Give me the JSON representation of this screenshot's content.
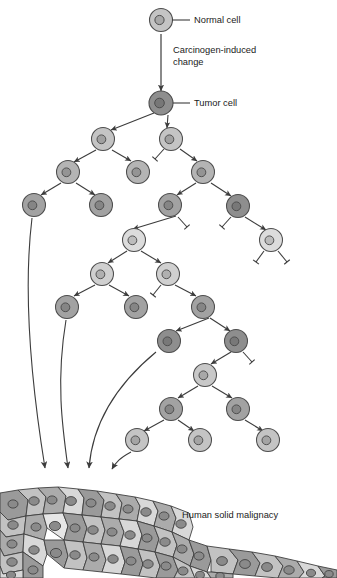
{
  "figure": {
    "title_visible": false,
    "type": "biological-schematic"
  },
  "labels": {
    "normal_cell": "Normal cell",
    "carcinogen_change_line1": "Carcinogen-induced",
    "carcinogen_change_line2": "change",
    "tumor_cell": "Tumor cell",
    "solid_malignancy": "Human solid malignacy"
  },
  "colors": {
    "background": "#ffffff",
    "outline": "#4d4d4d",
    "arrow": "#3c3c3c",
    "text": "#1a1a1a",
    "cell_lightest": "#e2e2e2",
    "cell_light": "#d2d2d2",
    "cell_medium_light": "#c4c4c4",
    "cell_medium": "#b4b4b4",
    "cell_medium_dark": "#a2a2a2",
    "cell_dark": "#8e8e8e",
    "nucleus_light": "#c0c0c0",
    "nucleus_medium": "#a0a0a0",
    "nucleus_dark": "#7c7c7c",
    "mass_fill_a": "#d8d8d8",
    "mass_fill_b": "#c2c2c2",
    "mass_fill_c": "#ababab",
    "mass_fill_d": "#9a9a9a",
    "mass_nucleus": "#8a8a8a"
  },
  "top_chain": {
    "normal_cell": {
      "x": 161,
      "y": 20,
      "r": 11.5,
      "fill": "#c4c4c4",
      "nucleus_r": 4.6,
      "nucleus_fill": "#a8a8a8"
    },
    "leader_line": {
      "x1": 172,
      "y1": 20,
      "x2": 190,
      "y2": 20
    },
    "normal_cell_label_pos": {
      "x": 194,
      "y": 23
    },
    "vertical_arrow": {
      "x": 161,
      "y1": 34,
      "y2": 91
    },
    "carcinogen_label_pos": {
      "x": 173,
      "y": 53
    },
    "tumor_cell": {
      "x": 161,
      "y": 103,
      "r": 12,
      "fill": "#8e8e8e",
      "nucleus_r": 4.8,
      "nucleus_fill": "#777777"
    },
    "tumor_leader_line": {
      "x1": 173,
      "y1": 103,
      "x2": 190,
      "y2": 103
    },
    "tumor_cell_label_pos": {
      "x": 194,
      "y": 106
    }
  },
  "tree_nodes": [
    {
      "id": "n1",
      "x": 103,
      "y": 139,
      "r": 11.5,
      "fill": "#c4c4c4",
      "nucleus_fill": "#a0a0a0",
      "nucleus_r": 4.4
    },
    {
      "id": "n2",
      "x": 171,
      "y": 139,
      "r": 11.5,
      "fill": "#c4c4c4",
      "nucleus_fill": "#a0a0a0",
      "nucleus_r": 4.4
    },
    {
      "id": "n3",
      "x": 68,
      "y": 172,
      "r": 11.5,
      "fill": "#b4b4b4",
      "nucleus_fill": "#949494",
      "nucleus_r": 4.4
    },
    {
      "id": "n4",
      "x": 138,
      "y": 172,
      "r": 11.5,
      "fill": "#b4b4b4",
      "nucleus_fill": "#949494",
      "nucleus_r": 4.4
    },
    {
      "id": "n5",
      "x": 203,
      "y": 172,
      "r": 11.5,
      "fill": "#b4b4b4",
      "nucleus_fill": "#949494",
      "nucleus_r": 4.4
    },
    {
      "id": "n6",
      "x": 34,
      "y": 205,
      "r": 11.5,
      "fill": "#a2a2a2",
      "nucleus_fill": "#858585",
      "nucleus_r": 4.4
    },
    {
      "id": "n7",
      "x": 101,
      "y": 205,
      "r": 11.5,
      "fill": "#a2a2a2",
      "nucleus_fill": "#858585",
      "nucleus_r": 4.4
    },
    {
      "id": "n8",
      "x": 170,
      "y": 205,
      "r": 11.5,
      "fill": "#a2a2a2",
      "nucleus_fill": "#858585",
      "nucleus_r": 4.4
    },
    {
      "id": "n9",
      "x": 238,
      "y": 206,
      "r": 11.5,
      "fill": "#8e8e8e",
      "nucleus_fill": "#787878",
      "nucleus_r": 4.4
    },
    {
      "id": "n10",
      "x": 134,
      "y": 240,
      "r": 11.5,
      "fill": "#dcdcdc",
      "nucleus_fill": "#bcbcbc",
      "nucleus_r": 4.4
    },
    {
      "id": "n11",
      "x": 271,
      "y": 240,
      "r": 11.5,
      "fill": "#dcdcdc",
      "nucleus_fill": "#bcbcbc",
      "nucleus_r": 4.4
    },
    {
      "id": "n12",
      "x": 102,
      "y": 274,
      "r": 11.5,
      "fill": "#d0d0d0",
      "nucleus_fill": "#b0b0b0",
      "nucleus_r": 4.4
    },
    {
      "id": "n13",
      "x": 168,
      "y": 274,
      "r": 11.5,
      "fill": "#d0d0d0",
      "nucleus_fill": "#b0b0b0",
      "nucleus_r": 4.4
    },
    {
      "id": "n14",
      "x": 67,
      "y": 307,
      "r": 11.5,
      "fill": "#a2a2a2",
      "nucleus_fill": "#858585",
      "nucleus_r": 4.4
    },
    {
      "id": "n15",
      "x": 136,
      "y": 307,
      "r": 11.5,
      "fill": "#a2a2a2",
      "nucleus_fill": "#858585",
      "nucleus_r": 4.4
    },
    {
      "id": "n16",
      "x": 203,
      "y": 307,
      "r": 11.5,
      "fill": "#a2a2a2",
      "nucleus_fill": "#858585",
      "nucleus_r": 4.4
    },
    {
      "id": "n17",
      "x": 169,
      "y": 341,
      "r": 11.5,
      "fill": "#8e8e8e",
      "nucleus_fill": "#787878",
      "nucleus_r": 4.4
    },
    {
      "id": "n18",
      "x": 236,
      "y": 341,
      "r": 11.5,
      "fill": "#8e8e8e",
      "nucleus_fill": "#787878",
      "nucleus_r": 4.4
    },
    {
      "id": "n19",
      "x": 205,
      "y": 375,
      "r": 11.5,
      "fill": "#c8c8c8",
      "nucleus_fill": "#a8a8a8",
      "nucleus_r": 4.4
    },
    {
      "id": "n20",
      "x": 171,
      "y": 409,
      "r": 11.5,
      "fill": "#a2a2a2",
      "nucleus_fill": "#858585",
      "nucleus_r": 4.4
    },
    {
      "id": "n21",
      "x": 238,
      "y": 409,
      "r": 11.5,
      "fill": "#a2a2a2",
      "nucleus_fill": "#858585",
      "nucleus_r": 4.4
    },
    {
      "id": "n22",
      "x": 137,
      "y": 440,
      "r": 11.5,
      "fill": "#c4c4c4",
      "nucleus_fill": "#a4a4a4",
      "nucleus_r": 4.4
    },
    {
      "id": "n23",
      "x": 200,
      "y": 440,
      "r": 11.5,
      "fill": "#c4c4c4",
      "nucleus_fill": "#a4a4a4",
      "nucleus_r": 4.4
    },
    {
      "id": "n24",
      "x": 268,
      "y": 440,
      "r": 11.5,
      "fill": "#c4c4c4",
      "nucleus_fill": "#a4a4a4",
      "nucleus_r": 4.4
    }
  ],
  "tree_arrows": [
    {
      "from": [
        154,
        113
      ],
      "to": [
        111,
        130
      ]
    },
    {
      "from": [
        168,
        115
      ],
      "to": [
        167,
        128
      ]
    },
    {
      "from": [
        96,
        150
      ],
      "to": [
        74,
        162
      ]
    },
    {
      "from": [
        112,
        150
      ],
      "to": [
        131,
        161
      ]
    },
    {
      "from": [
        180,
        149
      ],
      "to": [
        197,
        161
      ]
    },
    {
      "from": [
        61,
        183
      ],
      "to": [
        41,
        195
      ]
    },
    {
      "from": [
        76,
        183
      ],
      "to": [
        95,
        195
      ]
    },
    {
      "from": [
        196,
        183
      ],
      "to": [
        177,
        195
      ]
    },
    {
      "from": [
        211,
        183
      ],
      "to": [
        231,
        196
      ]
    },
    {
      "from": [
        176,
        216
      ],
      "to": [
        133,
        229
      ]
    },
    {
      "from": [
        245,
        217
      ],
      "to": [
        266,
        230
      ]
    },
    {
      "from": [
        127,
        251
      ],
      "to": [
        108,
        263
      ]
    },
    {
      "from": [
        141,
        251
      ],
      "to": [
        161,
        263
      ]
    },
    {
      "from": [
        95,
        285
      ],
      "to": [
        74,
        296
      ]
    },
    {
      "from": [
        109,
        285
      ],
      "to": [
        129,
        296
      ]
    },
    {
      "from": [
        175,
        285
      ],
      "to": [
        196,
        296
      ]
    },
    {
      "from": [
        209,
        318
      ],
      "to": [
        176,
        331
      ]
    },
    {
      "from": [
        210,
        318
      ],
      "to": [
        230,
        331
      ]
    },
    {
      "from": [
        231,
        352
      ],
      "to": [
        211,
        364
      ]
    },
    {
      "from": [
        198,
        386
      ],
      "to": [
        178,
        398
      ]
    },
    {
      "from": [
        212,
        386
      ],
      "to": [
        232,
        398
      ]
    },
    {
      "from": [
        164,
        420
      ],
      "to": [
        144,
        431
      ]
    },
    {
      "from": [
        178,
        420
      ],
      "to": [
        194,
        431
      ]
    },
    {
      "from": [
        245,
        420
      ],
      "to": [
        263,
        431
      ]
    }
  ],
  "dead_end_bars": [
    {
      "from": [
        164,
        149
      ],
      "to": [
        155,
        159
      ]
    },
    {
      "from": [
        178,
        217
      ],
      "to": [
        187,
        227
      ]
    },
    {
      "from": [
        231,
        217
      ],
      "to": [
        222,
        227
      ]
    },
    {
      "from": [
        264,
        251
      ],
      "to": [
        256,
        262
      ]
    },
    {
      "from": [
        278,
        251
      ],
      "to": [
        287,
        262
      ]
    },
    {
      "from": [
        161,
        285
      ],
      "to": [
        153,
        295
      ]
    },
    {
      "from": [
        243,
        352
      ],
      "to": [
        252,
        362
      ]
    }
  ],
  "metastasis_arrows": [
    {
      "start": [
        32,
        218
      ],
      "c1": [
        22,
        300
      ],
      "c2": [
        34,
        400
      ],
      "end": [
        45,
        468
      ]
    },
    {
      "start": [
        66,
        320
      ],
      "c1": [
        56,
        380
      ],
      "c2": [
        62,
        425
      ],
      "end": [
        68,
        468
      ]
    },
    {
      "start": [
        156,
        352
      ],
      "c1": [
        110,
        390
      ],
      "c2": [
        92,
        430
      ],
      "end": [
        89,
        468
      ]
    },
    {
      "start": [
        131,
        452
      ],
      "c1": [
        120,
        458
      ],
      "c2": [
        116,
        462
      ],
      "end": [
        112,
        469
      ]
    }
  ],
  "tumor_mass": {
    "outline_top_y": 487,
    "label_pos": {
      "x": 182,
      "y": 518
    },
    "cells": [
      {
        "pts": "0,493 18,490 28,500 26,516 8,520 0,512",
        "fill": "#9a9a9a",
        "nx": 13,
        "ny": 504,
        "nr": 5.0
      },
      {
        "pts": "18,490 38,488 46,497 43,514 26,516 28,500",
        "fill": "#c2c2c2",
        "nx": 34,
        "ny": 501,
        "nr": 5.2
      },
      {
        "pts": "38,488 58,487 66,496 63,513 43,514 46,497",
        "fill": "#ababab",
        "nx": 52,
        "ny": 500,
        "nr": 5.0
      },
      {
        "pts": "58,487 78,489 84,498 82,515 63,513 66,496",
        "fill": "#d8d8d8",
        "nx": 71,
        "ny": 501,
        "nr": 5.4
      },
      {
        "pts": "78,489 97,491 104,500 101,517 82,515 84,498",
        "fill": "#9a9a9a",
        "nx": 91,
        "ny": 503,
        "nr": 5.0
      },
      {
        "pts": "97,491 116,494 122,503 119,519 101,517 104,500",
        "fill": "#c2c2c2",
        "nx": 110,
        "ny": 506,
        "nr": 5.2
      },
      {
        "pts": "116,494 135,497 140,506 137,521 119,519 122,503",
        "fill": "#ababab",
        "nx": 128,
        "ny": 509,
        "nr": 5.0
      },
      {
        "pts": "135,497 153,501 158,511 154,526 137,521 140,506",
        "fill": "#d8d8d8",
        "nx": 146,
        "ny": 512,
        "nr": 5.2
      },
      {
        "pts": "0,512 8,520 26,516 24,534 6,537 0,530",
        "fill": "#c2c2c2",
        "nx": 13,
        "ny": 525,
        "nr": 5.2
      },
      {
        "pts": "26,516 43,514 47,528 44,540 24,534",
        "fill": "#ababab",
        "nx": 36,
        "ny": 527,
        "nr": 5.0
      },
      {
        "pts": "43,514 63,513 68,526 64,540 47,528",
        "fill": "#e6e6e6",
        "nx": 55,
        "ny": 526,
        "nr": 5.6
      },
      {
        "pts": "63,513 82,515 87,528 83,542 64,540 68,526",
        "fill": "#9a9a9a",
        "nx": 75,
        "ny": 528,
        "nr": 5.0
      },
      {
        "pts": "82,515 101,517 105,530 101,544 83,542 87,528",
        "fill": "#c2c2c2",
        "nx": 93,
        "ny": 530,
        "nr": 5.2
      },
      {
        "pts": "101,517 119,519 124,532 120,546 101,544 105,530",
        "fill": "#ababab",
        "nx": 112,
        "ny": 532,
        "nr": 5.0
      },
      {
        "pts": "119,519 137,521 142,535 138,549 120,546 124,532",
        "fill": "#d8d8d8",
        "nx": 130,
        "ny": 535,
        "nr": 5.2
      },
      {
        "pts": "137,521 154,526 159,539 155,552 138,549 142,535",
        "fill": "#9a9a9a",
        "nx": 147,
        "ny": 538,
        "nr": 5.0
      },
      {
        "pts": "0,530 6,537 24,534 23,552 4,556 0,548",
        "fill": "#ababab",
        "nx": 12,
        "ny": 544,
        "nr": 5.0
      },
      {
        "pts": "24,534 44,540 47,554 43,566 23,552",
        "fill": "#d8d8d8",
        "nx": 34,
        "ny": 550,
        "nr": 5.2
      },
      {
        "pts": "44,540 64,540 68,556 64,568 47,554",
        "fill": "#9a9a9a",
        "nx": 56,
        "ny": 553,
        "nr": 5.6
      },
      {
        "pts": "64,540 83,542 87,558 83,570 64,568 68,556",
        "fill": "#c2c2c2",
        "nx": 75,
        "ny": 555,
        "nr": 5.2
      },
      {
        "pts": "83,542 101,544 106,560 102,572 83,570 87,558",
        "fill": "#ababab",
        "nx": 94,
        "ny": 557,
        "nr": 5.0
      },
      {
        "pts": "101,544 120,546 125,562 121,574 102,572 106,560",
        "fill": "#d8d8d8",
        "nx": 113,
        "ny": 559,
        "nr": 5.2
      },
      {
        "pts": "120,546 138,549 143,564 139,576 121,574 125,562",
        "fill": "#9a9a9a",
        "nx": 131,
        "ny": 561,
        "nr": 5.0
      },
      {
        "pts": "138,549 155,552 160,566 156,578 139,576 143,564",
        "fill": "#c2c2c2",
        "nx": 148,
        "ny": 564,
        "nr": 5.2
      },
      {
        "pts": "0,548 4,556 23,552 23,570 3,574 0,566",
        "fill": "#c2c2c2",
        "nx": 12,
        "ny": 562,
        "nr": 5.2
      },
      {
        "pts": "23,552 43,566 43,578 23,578 23,570",
        "fill": "#9a9a9a",
        "nx": 33,
        "ny": 570,
        "nr": 5.0
      },
      {
        "pts": "0,566 3,574 23,570 23,578 0,578",
        "fill": "#d8d8d8",
        "nx": 11,
        "ny": 575,
        "nr": 4.6
      },
      {
        "pts": "153,501 171,506 176,518 172,532 154,526 158,511",
        "fill": "#ababab",
        "nx": 164,
        "ny": 516,
        "nr": 5.0
      },
      {
        "pts": "154,526 172,532 177,545 173,557 155,552 159,539",
        "fill": "#c2c2c2",
        "nx": 165,
        "ny": 542,
        "nr": 5.2
      },
      {
        "pts": "155,552 173,557 178,570 174,578 156,578 160,566",
        "fill": "#9a9a9a",
        "nx": 166,
        "ny": 566,
        "nr": 5.0
      },
      {
        "pts": "171,506 189,513 193,527 189,540 172,532 176,518",
        "fill": "#d8d8d8",
        "nx": 181,
        "ny": 524,
        "nr": 5.2
      },
      {
        "pts": "172,532 189,540 194,554 190,566 173,557 177,545",
        "fill": "#ababab",
        "nx": 182,
        "ny": 549,
        "nr": 5.0
      },
      {
        "pts": "173,557 190,566 195,578 174,578 178,570",
        "fill": "#c2c2c2",
        "nx": 183,
        "ny": 571,
        "nr": 5.0
      },
      {
        "pts": "189,540 207,546 211,560 207,572 190,566 194,554",
        "fill": "#9a9a9a",
        "nx": 199,
        "ny": 556,
        "nr": 5.0
      },
      {
        "pts": "190,566 207,572 211,578 195,578",
        "fill": "#d8d8d8",
        "nx": 200,
        "ny": 575,
        "nr": 4.4
      },
      {
        "pts": "207,546 229,549 238,560 233,574 211,572 211,560",
        "fill": "#c2c2c2",
        "nx": 222,
        "ny": 561,
        "nr": 5.4
      },
      {
        "pts": "207,572 211,578 233,578 233,574 211,572",
        "fill": "#ababab",
        "nx": 220,
        "ny": 576,
        "nr": 4.2
      },
      {
        "pts": "229,549 252,552 260,563 255,576 233,574 238,560",
        "fill": "#9a9a9a",
        "nx": 245,
        "ny": 564,
        "nr": 5.4
      },
      {
        "pts": "252,552 275,556 283,566 278,578 255,576 260,563",
        "fill": "#c2c2c2",
        "nx": 267,
        "ny": 567,
        "nr": 5.4
      },
      {
        "pts": "275,556 297,561 304,572 299,578 278,578 283,566",
        "fill": "#ababab",
        "nx": 289,
        "ny": 570,
        "nr": 5.2
      },
      {
        "pts": "297,561 318,566 325,576 322,578 299,578 304,572",
        "fill": "#d8d8d8",
        "nx": 311,
        "ny": 573,
        "nr": 4.6
      },
      {
        "pts": "318,566 337,570 337,578 322,578 325,576",
        "fill": "#9a9a9a",
        "nx": 329,
        "ny": 574,
        "nr": 4.2
      }
    ]
  }
}
